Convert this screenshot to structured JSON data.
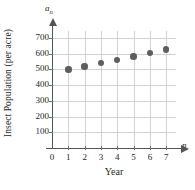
{
  "chart_data": {
    "type": "scatter",
    "title": "",
    "xlabel": "Year",
    "ylabel": "Insect Population (per acre)",
    "x_axis_variable": "n",
    "y_axis_variable": "a",
    "y_axis_variable_subscript": "n",
    "x": [
      1,
      2,
      3,
      4,
      5,
      6,
      7
    ],
    "values": [
      500,
      520,
      541,
      562,
      583,
      605,
      628
    ],
    "series": [
      {
        "name": "Insect Population",
        "values": [
          500,
          520,
          541,
          562,
          583,
          605,
          628
        ]
      }
    ],
    "xlim": [
      0,
      7.6
    ],
    "ylim": [
      0,
      745
    ],
    "xticks": [
      "0",
      "1",
      "2",
      "3",
      "4",
      "5",
      "6",
      "7"
    ],
    "xtick_values": [
      0,
      1,
      2,
      3,
      4,
      5,
      6,
      7
    ],
    "yticks": [
      "100",
      "200",
      "300",
      "400",
      "500",
      "600",
      "700"
    ],
    "ytick_values": [
      100,
      200,
      300,
      400,
      500,
      600,
      700
    ],
    "grid": true,
    "legend": false,
    "marker_color": "#5e5e60",
    "grid_color": "#d2d2d2",
    "axis_color": "#555557",
    "text_color": "#231f20"
  }
}
